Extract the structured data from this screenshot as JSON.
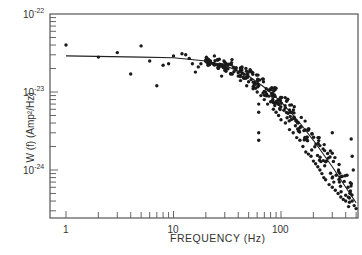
{
  "chart_data": {
    "type": "scatter",
    "title": "",
    "xlabel": "FREQUENCY (Hz)",
    "ylabel": "W (f) (Amp²/Hz)",
    "xscale": "log",
    "yscale": "log",
    "xlim": [
      0.85,
      520
    ],
    "ylim": [
      2.5e-25,
      1e-22
    ],
    "grid": false,
    "legend": null,
    "x_tick_labels": [
      "1",
      "10",
      "100"
    ],
    "y_tick_labels": [
      {
        "base": "10",
        "exp": "-22"
      },
      {
        "base": "10",
        "exp": "-23"
      },
      {
        "base": "10",
        "exp": "-24"
      }
    ],
    "series": [
      {
        "name": "measured",
        "kind": "points",
        "x": [
          1,
          2,
          3,
          4,
          5,
          6,
          7,
          8,
          9,
          10,
          12,
          13,
          14,
          15,
          16,
          17,
          18,
          20,
          22,
          24,
          26,
          28,
          30,
          32,
          35,
          38,
          40,
          42,
          45,
          48,
          50,
          55,
          60,
          65,
          70,
          75,
          80,
          85,
          90,
          95,
          100,
          110,
          120,
          130,
          140,
          150,
          160,
          170,
          180,
          190,
          200,
          210,
          220,
          230,
          240,
          250,
          260,
          280,
          300,
          320,
          340,
          360,
          380,
          400,
          420,
          440,
          460,
          480,
          500,
          62,
          62,
          62,
          62,
          300,
          450,
          460,
          470
        ],
        "y": [
          4e-23,
          2.8e-23,
          3.2e-23,
          1.7e-23,
          3.9e-23,
          2.5e-23,
          1.2e-23,
          2.2e-23,
          2.3e-23,
          2.9e-23,
          3.1e-23,
          3e-23,
          2.7e-23,
          2.3e-23,
          1.8e-23,
          2.1e-23,
          2.3e-23,
          2.6e-23,
          2.5e-23,
          2.9e-23,
          2.2e-23,
          1.6e-23,
          1.9e-23,
          2.2e-23,
          2.6e-23,
          2e-23,
          1.6e-23,
          1.4e-23,
          1.5e-23,
          1.2e-23,
          1.35e-23,
          1.1e-23,
          1e-23,
          9e-24,
          8e-24,
          7e-24,
          7.5e-24,
          6e-24,
          5.5e-24,
          5e-24,
          4.4e-24,
          4e-24,
          3.3e-24,
          3e-24,
          2.6e-24,
          2.4e-24,
          2e-24,
          1.7e-24,
          1.6e-24,
          1.5e-24,
          1.3e-24,
          1.2e-24,
          1.1e-24,
          1e-24,
          9e-25,
          8e-25,
          7.5e-25,
          6.5e-25,
          6e-25,
          5.5e-25,
          5e-25,
          4.5e-25,
          4.2e-25,
          4e-25,
          6e-25,
          5e-25,
          4e-25,
          3.5e-25,
          3.2e-25,
          7e-24,
          5.5e-24,
          3e-24,
          2.4e-24,
          3e-24,
          2.5e-24,
          1.5e-24,
          1e-24
        ]
      },
      {
        "name": "fit",
        "kind": "line",
        "x": [
          1,
          5,
          10,
          20,
          30,
          50,
          70,
          100,
          150,
          200,
          300,
          400,
          500
        ],
        "y": [
          2.9e-23,
          2.8e-23,
          2.75e-23,
          2.5e-23,
          2.2e-23,
          1.6e-23,
          1.15e-23,
          7.5e-24,
          4e-24,
          2.4e-24,
          1.1e-24,
          6e-25,
          3.8e-25
        ]
      }
    ]
  }
}
